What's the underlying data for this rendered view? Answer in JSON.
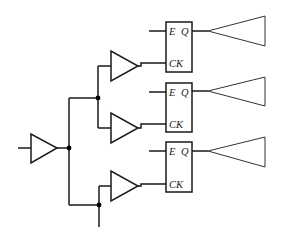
{
  "diagram": {
    "type": "clock-tree-with-enable-flip-flops",
    "colors": {
      "stroke": "#1a1a1a",
      "background": "#ffffff",
      "junction": "#000000"
    },
    "flip_flops": [
      {
        "id": "ff1",
        "pins": {
          "enable": "E",
          "output": "Q",
          "clock": "CK"
        }
      },
      {
        "id": "ff2",
        "pins": {
          "enable": "E",
          "output": "Q",
          "clock": "CK"
        }
      },
      {
        "id": "ff3",
        "pins": {
          "enable": "E",
          "output": "Q",
          "clock": "CK"
        }
      }
    ],
    "buffers": {
      "root": "input-clock-buffer",
      "branches": [
        "branch-buffer-1",
        "branch-buffer-2",
        "branch-buffer-3"
      ],
      "loads": [
        "output-load-buffer-1",
        "output-load-buffer-2",
        "output-load-buffer-3"
      ]
    },
    "junctions": 3
  }
}
